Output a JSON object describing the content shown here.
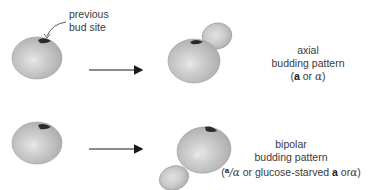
{
  "annotation": {
    "line1": "previous",
    "line2": "bud site"
  },
  "rows": [
    {
      "id": "axial",
      "title": "axial",
      "subtitle": "budding pattern",
      "condition": {
        "open": "(",
        "a": "a",
        "or": " or ",
        "alpha": "α",
        "close": ")"
      }
    },
    {
      "id": "bipolar",
      "title": "bipolar",
      "subtitle": "budding pattern",
      "condition": {
        "open": "(",
        "a_sup": "a",
        "slash_alpha": "/α",
        "middle": " or glucose-starved ",
        "a": "a",
        "or": " or",
        "alpha": "α",
        "close": ")"
      }
    }
  ],
  "colors": {
    "cell_fill": "#c4c4c4",
    "cell_highlight": "#e6e6e6",
    "cell_edge": "#9a9a9a",
    "bud_scar": "#2a2a2a",
    "arrow": "#1a1a1a"
  }
}
